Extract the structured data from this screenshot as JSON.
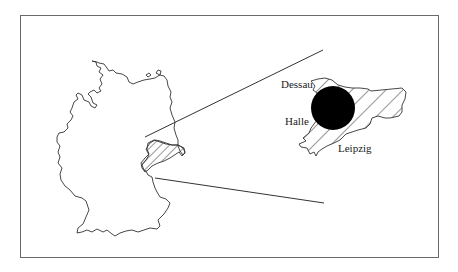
{
  "figure": {
    "frame_color": "#6a6a6a",
    "line_color": "#333333",
    "country_label": "",
    "inset": {
      "cities": [
        {
          "name": "Dessau",
          "x": 279,
          "y": 85
        },
        {
          "name": "Halle",
          "x": 284,
          "y": 125
        },
        {
          "name": "Leipzig",
          "x": 339,
          "y": 152
        }
      ],
      "marker": {
        "shape": "filled-circle",
        "color": "#000000",
        "cx": 333,
        "cy": 108,
        "r": 22
      }
    }
  }
}
